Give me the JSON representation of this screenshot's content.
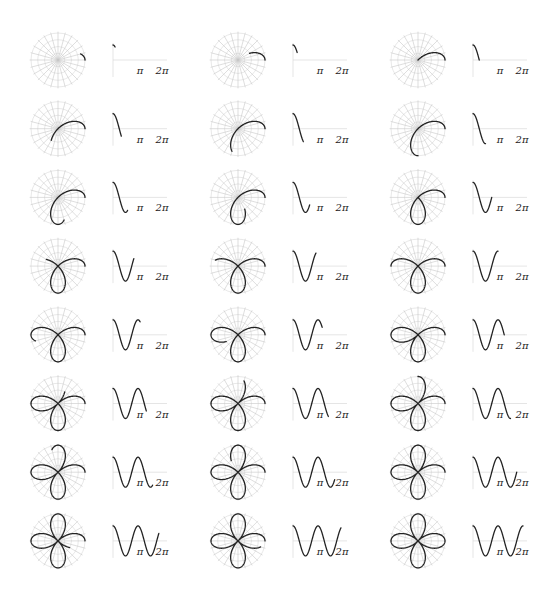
{
  "figure": {
    "title": "",
    "layout": {
      "rows": 8,
      "columns": 3,
      "frames": 24
    },
    "function": "r = cos(2θ)",
    "theta_step": "π/12",
    "colors": {
      "curve": "#222222",
      "grid": "#c8c8c8",
      "axis": "#d4d4d4",
      "background": "#ffffff"
    },
    "polar_grid": {
      "radial_lines": 24,
      "concentric_circles": 4
    },
    "cartesian_axis": {
      "tick_labels": [
        "π",
        "2π"
      ],
      "xlim": [
        "0",
        "2π"
      ],
      "ylim": [
        -1,
        1
      ]
    }
  },
  "frames": [
    {
      "index": 1,
      "theta_end": "π/12"
    },
    {
      "index": 2,
      "theta_end": "2π/12"
    },
    {
      "index": 3,
      "theta_end": "3π/12"
    },
    {
      "index": 4,
      "theta_end": "4π/12"
    },
    {
      "index": 5,
      "theta_end": "5π/12"
    },
    {
      "index": 6,
      "theta_end": "6π/12"
    },
    {
      "index": 7,
      "theta_end": "7π/12"
    },
    {
      "index": 8,
      "theta_end": "8π/12"
    },
    {
      "index": 9,
      "theta_end": "9π/12"
    },
    {
      "index": 10,
      "theta_end": "10π/12"
    },
    {
      "index": 11,
      "theta_end": "11π/12"
    },
    {
      "index": 12,
      "theta_end": "π"
    },
    {
      "index": 13,
      "theta_end": "13π/12"
    },
    {
      "index": 14,
      "theta_end": "14π/12"
    },
    {
      "index": 15,
      "theta_end": "15π/12"
    },
    {
      "index": 16,
      "theta_end": "16π/12"
    },
    {
      "index": 17,
      "theta_end": "17π/12"
    },
    {
      "index": 18,
      "theta_end": "18π/12"
    },
    {
      "index": 19,
      "theta_end": "19π/12"
    },
    {
      "index": 20,
      "theta_end": "20π/12"
    },
    {
      "index": 21,
      "theta_end": "21π/12"
    },
    {
      "index": 22,
      "theta_end": "22π/12"
    },
    {
      "index": 23,
      "theta_end": "23π/12"
    },
    {
      "index": 24,
      "theta_end": "2π"
    }
  ],
  "labels": {
    "pi": "π",
    "two_pi": "2π"
  },
  "geometry": {
    "col_polar_cx": [
      58,
      238,
      418
    ],
    "row_cy_start": 60,
    "row_spacing": 68.7,
    "polar_radius": 27,
    "cart_offset_x": 55,
    "cart_width": 50,
    "cart_amplitude": 15,
    "pi_label_dx": 82,
    "two_pi_label_dx": 104,
    "label_dy": 14
  }
}
